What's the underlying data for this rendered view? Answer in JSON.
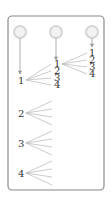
{
  "diagram": {
    "colors": {
      "frame": "#8a8a8a",
      "lines": "#b5b5b5",
      "circle": "#d6d6d6",
      "text": "#333333"
    },
    "columns": [
      {
        "name": "draw-1",
        "circle": true
      },
      {
        "name": "draw-2",
        "circle": true
      },
      {
        "name": "draw-3",
        "circle": true
      }
    ],
    "left_labels": [
      "1",
      "2",
      "3",
      "4"
    ],
    "middle_labels": [
      "1",
      "2",
      "3",
      "4"
    ],
    "right_labels": [
      "1",
      "2",
      "3",
      "4"
    ]
  }
}
